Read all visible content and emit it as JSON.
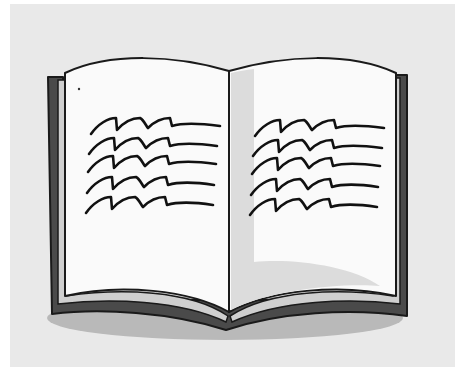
{
  "image": {
    "subject": "Open book clip-art illustration",
    "alt": "An open book with wavy lines representing text on both pages"
  },
  "colors": {
    "background": "#e9e9e9",
    "border_strip": "#ffffff",
    "cover": "#4a4a4a",
    "outline": "#1a1a1a",
    "page": "#fafafa",
    "page_edge": "#cfcfcf",
    "gutter_shade": "#d9d9d9",
    "page_shadow": "#dedede",
    "ground_shadow": "#b9b9b9",
    "text_lines": "#111111"
  },
  "book": {
    "left_page": {
      "text_line_count": 5
    },
    "right_page": {
      "text_line_count": 5
    }
  }
}
